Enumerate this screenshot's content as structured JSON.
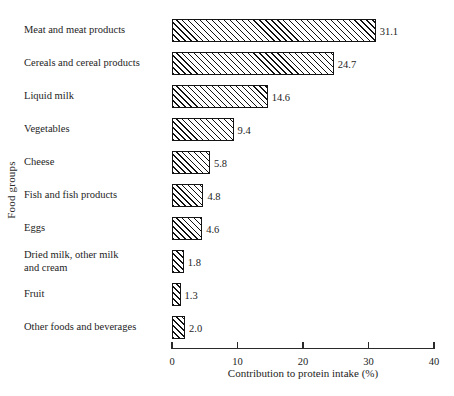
{
  "chart_data": {
    "type": "bar",
    "orientation": "horizontal",
    "title": "",
    "xlabel": "Contribution to protein intake (%)",
    "ylabel": "Food groups",
    "xlim": [
      0,
      40
    ],
    "xticks": [
      0,
      10,
      20,
      30,
      40
    ],
    "xtick_labels": [
      "0",
      "10",
      "20",
      "30",
      "40"
    ],
    "grid": false,
    "legend": null,
    "categories": [
      "Meat and meat products",
      "Cereals and cereal products",
      "Liquid milk",
      "Vegetables",
      "Cheese",
      "Fish and fish products",
      "Eggs",
      "Dried milk, other milk\nand cream",
      "Fruit",
      "Other foods and beverages"
    ],
    "values": [
      31.1,
      24.7,
      14.6,
      9.4,
      5.8,
      4.8,
      4.6,
      1.8,
      1.3,
      2.0
    ],
    "value_labels": [
      "31.1",
      "24.7",
      "14.6",
      "9.4",
      "5.8",
      "4.8",
      "4.6",
      "1.8",
      "1.3",
      "2.0"
    ],
    "bar_style": {
      "fill": "diagonal-hatch",
      "hatch_direction": "forward-slash",
      "edge_color": "#141414",
      "face_color": "#ffffff"
    }
  }
}
